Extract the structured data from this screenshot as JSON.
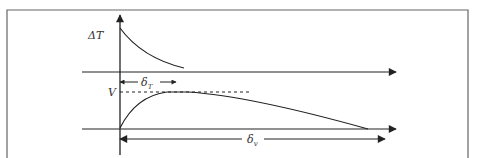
{
  "diagram": {
    "labels": {
      "delta_t_axis": "ΔT",
      "v_level": "V",
      "delta_t_thickness": "δ",
      "delta_t_sub": "T",
      "delta_v_thickness": "δ",
      "delta_v_sub": "v"
    },
    "colors": {
      "line": "#222222",
      "frame": "#666666"
    }
  }
}
